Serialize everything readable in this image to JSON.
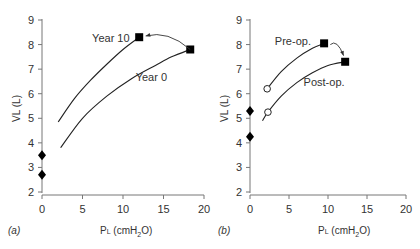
{
  "chart_data": [
    {
      "type": "line",
      "panel_label": "(a)",
      "xlabel": "PL (cmH2O)",
      "ylabel": "VL (L)",
      "xlim": [
        0,
        20
      ],
      "ylim": [
        2,
        9
      ],
      "xticks": [
        0,
        5,
        10,
        15,
        20
      ],
      "yticks": [
        2,
        3,
        4,
        5,
        6,
        7,
        8,
        9
      ],
      "grid": false,
      "series": [
        {
          "name": "Year 10",
          "x": [
            2,
            4,
            6,
            8,
            10,
            12
          ],
          "y": [
            4.85,
            5.8,
            6.55,
            7.2,
            7.8,
            8.3
          ],
          "end_marker": "filled-square"
        },
        {
          "name": "Year 0",
          "x": [
            2.3,
            5,
            8,
            11,
            14,
            16,
            18.3
          ],
          "y": [
            3.8,
            5.0,
            5.9,
            6.6,
            7.15,
            7.5,
            7.8
          ],
          "end_marker": "filled-square"
        },
        {
          "name": "Zero-pressure volumes",
          "x": [
            0,
            0
          ],
          "y": [
            3.5,
            2.7
          ],
          "marker": "filled-diamond"
        }
      ],
      "annotations": [
        {
          "text": "Year 10",
          "x": 8.5,
          "y": 8.1
        },
        {
          "text": "Year 0",
          "x": 13.5,
          "y": 6.5
        },
        {
          "type": "arrow",
          "from": [
            18.3,
            7.8
          ],
          "to": [
            12.8,
            8.35
          ]
        }
      ]
    },
    {
      "type": "line",
      "panel_label": "(b)",
      "xlabel": "PL (cmH2O)",
      "ylabel": "VL (L)",
      "xlim": [
        0,
        20
      ],
      "ylim": [
        2,
        9
      ],
      "xticks": [
        0,
        5,
        10,
        15,
        20
      ],
      "yticks": [
        2,
        3,
        4,
        5,
        6,
        7,
        8,
        9
      ],
      "grid": false,
      "series": [
        {
          "name": "Pre-op.",
          "x": [
            2.2,
            4,
            6,
            8,
            9.5
          ],
          "y": [
            6.2,
            6.9,
            7.45,
            7.85,
            8.05
          ],
          "start_marker": "open-circle",
          "end_marker": "filled-square"
        },
        {
          "name": "Post-op.",
          "x": [
            1.6,
            2.3,
            4,
            6,
            8,
            10,
            12.2
          ],
          "y": [
            4.9,
            5.25,
            5.9,
            6.45,
            6.85,
            7.15,
            7.3
          ],
          "marker_at": {
            "x": 2.3,
            "y": 5.25,
            "marker": "open-circle"
          },
          "end_marker": "filled-square"
        },
        {
          "name": "Zero-pressure volumes",
          "x": [
            0,
            0
          ],
          "y": [
            5.3,
            4.25
          ],
          "marker": "filled-diamond"
        }
      ],
      "annotations": [
        {
          "text": "Pre-op.",
          "x": 5.5,
          "y": 8.0
        },
        {
          "text": "Post-op.",
          "x": 9.5,
          "y": 6.3
        },
        {
          "type": "arrow",
          "from": [
            10.3,
            8.0
          ],
          "to": [
            12.0,
            7.55
          ]
        }
      ]
    }
  ],
  "panels": {
    "a": {
      "label": "(a)",
      "xlabel_main": "P",
      "xlabel_sub": "L",
      "xlabel_rest": " (cmH",
      "xlabel_sub2": "2",
      "xlabel_end": "O)",
      "ylabel": "VL (L)",
      "legend_top": "Year 10",
      "legend_bottom": "Year 0"
    },
    "b": {
      "label": "(b)",
      "xlabel_main": "P",
      "xlabel_sub": "L",
      "xlabel_rest": " (cmH",
      "xlabel_sub2": "2",
      "xlabel_end": "O)",
      "ylabel": "VL (L)",
      "legend_top": "Pre-op.",
      "legend_bottom": "Post-op."
    }
  }
}
